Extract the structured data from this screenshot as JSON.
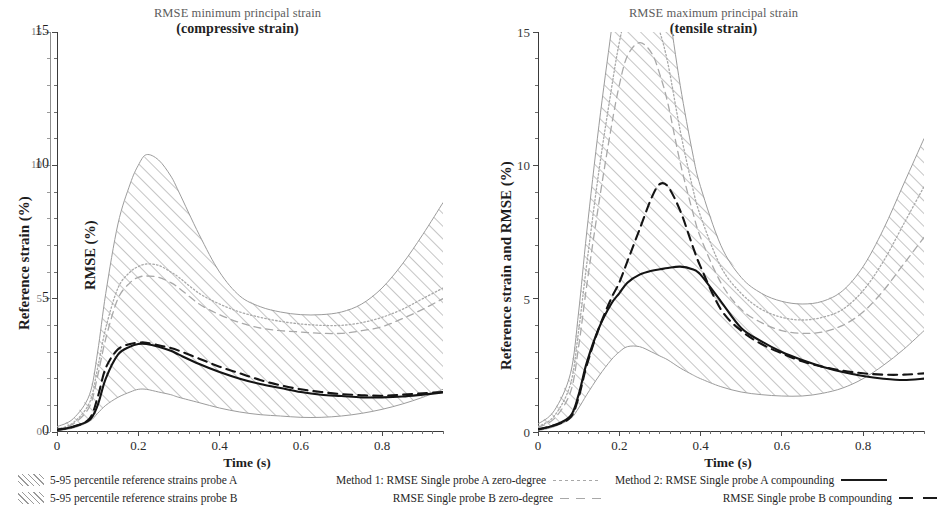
{
  "panels": [
    {
      "id": "left",
      "title_line1": "RMSE minimum principal strain",
      "title_line2": "(compressive strain)",
      "y_axis_outer_title": "Reference strain (%)",
      "y_axis_inner_title": "RMSE (%)",
      "x_axis_title": "Time (s)",
      "y_ticks": [
        "0",
        "5",
        "10",
        "15"
      ],
      "y_ticks_outer": [
        "0",
        "5",
        "10",
        "15"
      ],
      "x_ticks": [
        "0",
        "0.2",
        "0.4",
        "0.6",
        "0.8"
      ]
    },
    {
      "id": "right",
      "title_line1": "RMSE maximum principal strain",
      "title_line2": "(tensile strain)",
      "y_axis_title": "Reference strain and RMSE (%)",
      "x_axis_title": "Time (s)",
      "y_ticks": [
        "0",
        "5",
        "10",
        "15"
      ],
      "x_ticks": [
        "0",
        "0.2",
        "0.4",
        "0.6",
        "0.8"
      ]
    }
  ],
  "legend": {
    "bands": [
      "5-95 percentile reference strains probe A",
      "5-95 percentile reference strains probe B"
    ],
    "method1": [
      "Method 1: RMSE Single probe A zero-degree",
      "RMSE Single probe B zero-degree"
    ],
    "method2": [
      "Method 2: RMSE Single probe A compounding",
      "RMSE Single probe B compounding"
    ]
  },
  "colors": {
    "band_hatch": "#9a9a9a",
    "method1": "#a8a8a8",
    "method2": "#1a1a1a",
    "axis": "#3a3a3a",
    "axis_faint": "#8f8f8f"
  },
  "chart_data": {
    "type": "line",
    "panels": [
      {
        "name": "RMSE minimum principal strain (compressive strain)",
        "xlabel": "Time (s)",
        "ylabel_outer": "Reference strain (%)",
        "ylabel_inner": "RMSE (%)",
        "xlim": [
          0,
          0.95
        ],
        "ylim": [
          0,
          15
        ],
        "grid": false,
        "x": [
          0,
          0.04,
          0.08,
          0.1,
          0.12,
          0.15,
          0.18,
          0.2,
          0.22,
          0.25,
          0.28,
          0.3,
          0.35,
          0.4,
          0.45,
          0.5,
          0.55,
          0.6,
          0.65,
          0.7,
          0.75,
          0.8,
          0.85,
          0.9,
          0.95
        ],
        "series": [
          {
            "name": "5-95 percentile reference strains probe A upper",
            "style": "hatch-band-upper",
            "values": [
              0.2,
              0.5,
              1.4,
              3.0,
              5.2,
              7.8,
              9.3,
              10.0,
              10.4,
              10.2,
              9.6,
              9.0,
              7.4,
              6.0,
              5.1,
              4.7,
              4.5,
              4.4,
              4.4,
              4.5,
              4.8,
              5.4,
              6.3,
              7.4,
              8.6
            ]
          },
          {
            "name": "5-95 percentile reference strains probe A lower",
            "style": "hatch-band-lower",
            "values": [
              0.05,
              0.15,
              0.4,
              0.7,
              1.0,
              1.3,
              1.5,
              1.6,
              1.6,
              1.5,
              1.4,
              1.3,
              1.1,
              0.9,
              0.75,
              0.65,
              0.6,
              0.55,
              0.55,
              0.6,
              0.7,
              0.85,
              1.05,
              1.3,
              1.6
            ]
          },
          {
            "name": "Method 1: RMSE Single probe A zero-degree",
            "style": "dotted-gray",
            "values": [
              0.1,
              0.35,
              1.1,
              2.4,
              3.9,
              5.4,
              6.0,
              6.2,
              6.3,
              6.25,
              6.0,
              5.8,
              5.2,
              4.8,
              4.5,
              4.3,
              4.15,
              4.05,
              4.0,
              4.0,
              4.1,
              4.3,
              4.6,
              5.0,
              5.4
            ]
          },
          {
            "name": "RMSE Single probe B zero-degree",
            "style": "dashed-gray",
            "values": [
              0.1,
              0.3,
              0.95,
              2.1,
              3.5,
              5.0,
              5.6,
              5.8,
              5.85,
              5.8,
              5.6,
              5.4,
              4.8,
              4.4,
              4.1,
              3.9,
              3.8,
              3.75,
              3.7,
              3.7,
              3.8,
              3.95,
              4.25,
              4.6,
              5.0
            ]
          },
          {
            "name": "Method 2: RMSE Single probe A compounding",
            "style": "solid-black",
            "values": [
              0.08,
              0.2,
              0.45,
              1.0,
              2.0,
              2.9,
              3.2,
              3.3,
              3.3,
              3.2,
              3.05,
              2.9,
              2.55,
              2.25,
              2.0,
              1.8,
              1.65,
              1.5,
              1.4,
              1.35,
              1.3,
              1.3,
              1.33,
              1.4,
              1.48
            ]
          },
          {
            "name": "RMSE Single probe B compounding",
            "style": "dashed-black",
            "values": [
              0.08,
              0.2,
              0.5,
              1.3,
              2.4,
              3.1,
              3.3,
              3.35,
              3.35,
              3.25,
              3.15,
              3.05,
              2.75,
              2.45,
              2.2,
              1.95,
              1.75,
              1.6,
              1.5,
              1.42,
              1.38,
              1.36,
              1.4,
              1.45,
              1.5
            ]
          }
        ]
      },
      {
        "name": "RMSE maximum principal strain (tensile strain)",
        "xlabel": "Time (s)",
        "ylabel": "Reference strain and RMSE (%)",
        "xlim": [
          0,
          0.95
        ],
        "ylim": [
          0,
          15
        ],
        "grid": false,
        "x": [
          0,
          0.04,
          0.08,
          0.1,
          0.12,
          0.15,
          0.18,
          0.2,
          0.22,
          0.25,
          0.28,
          0.3,
          0.32,
          0.35,
          0.38,
          0.4,
          0.45,
          0.5,
          0.55,
          0.6,
          0.65,
          0.7,
          0.75,
          0.8,
          0.85,
          0.9,
          0.95
        ],
        "series": [
          {
            "name": "5-95 percentile reference strains probe A upper",
            "style": "hatch-band-upper",
            "values": [
              0.3,
              0.8,
              2.2,
              4.5,
              7.5,
              11.5,
              15.0,
              17.2,
              18.5,
              19.2,
              18.6,
              17.5,
              16.0,
              13.0,
              10.5,
              9.2,
              7.0,
              5.8,
              5.2,
              4.9,
              4.8,
              4.9,
              5.3,
              6.2,
              7.6,
              9.3,
              11.0
            ]
          },
          {
            "name": "5-95 percentile reference strains probe A lower",
            "style": "hatch-band-lower",
            "values": [
              0.05,
              0.2,
              0.5,
              0.9,
              1.4,
              2.1,
              2.7,
              3.0,
              3.2,
              3.2,
              3.0,
              2.85,
              2.7,
              2.4,
              2.15,
              2.0,
              1.7,
              1.5,
              1.4,
              1.35,
              1.35,
              1.45,
              1.65,
              2.0,
              2.5,
              3.1,
              3.8
            ]
          },
          {
            "name": "Method 1: RMSE Single probe A zero-degree",
            "style": "dotted-gray",
            "values": [
              0.2,
              0.6,
              1.8,
              3.8,
              6.3,
              9.8,
              12.8,
              14.6,
              15.8,
              16.4,
              15.9,
              15.0,
              13.8,
              11.3,
              9.2,
              8.1,
              6.2,
              5.2,
              4.6,
              4.3,
              4.2,
              4.3,
              4.6,
              5.3,
              6.4,
              7.8,
              9.2
            ]
          },
          {
            "name": "RMSE Single probe B zero-degree",
            "style": "dashed-gray",
            "values": [
              0.18,
              0.5,
              1.5,
              3.2,
              5.5,
              8.6,
              11.4,
              13.0,
              14.1,
              14.6,
              14.2,
              13.4,
              12.3,
              10.1,
              8.3,
              7.3,
              5.6,
              4.6,
              4.1,
              3.8,
              3.7,
              3.75,
              4.0,
              4.5,
              5.3,
              6.3,
              7.3
            ]
          },
          {
            "name": "Method 2: RMSE Single probe A compounding",
            "style": "solid-black",
            "values": [
              0.1,
              0.25,
              0.6,
              1.4,
              2.6,
              3.9,
              4.8,
              5.2,
              5.6,
              5.9,
              6.05,
              6.1,
              6.15,
              6.2,
              6.1,
              5.9,
              4.9,
              3.9,
              3.4,
              3.0,
              2.7,
              2.45,
              2.25,
              2.1,
              2.0,
              1.95,
              2.0
            ]
          },
          {
            "name": "RMSE Single probe B compounding",
            "style": "dashed-black",
            "values": [
              0.1,
              0.25,
              0.55,
              1.3,
              2.5,
              3.9,
              5.0,
              5.6,
              6.4,
              7.6,
              8.8,
              9.3,
              9.2,
              8.3,
              7.0,
              6.2,
              4.6,
              3.8,
              3.3,
              2.95,
              2.65,
              2.45,
              2.3,
              2.2,
              2.15,
              2.15,
              2.2
            ]
          }
        ]
      }
    ]
  }
}
